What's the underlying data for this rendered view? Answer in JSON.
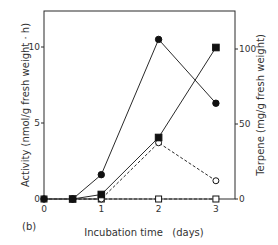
{
  "figure": {
    "panel_label": "(b)"
  },
  "chart_data": {
    "type": "line",
    "title": "",
    "panel_label": "(b)",
    "xlabel": "Incubation time   (days)",
    "ylabel_left": "Activity (nmol/g fresh weight · h)",
    "ylabel_right": "Terpene  (mg/g fresh weight)",
    "xlim": [
      0,
      3.35
    ],
    "ylim_left": [
      0,
      12.5
    ],
    "ylim_right": [
      0,
      125
    ],
    "x_ticks": [
      0,
      1,
      2,
      3
    ],
    "x_tick_labels": [
      "0",
      "1",
      "2",
      "3"
    ],
    "y_left_ticks": [
      0,
      5,
      10
    ],
    "y_left_tick_labels": [
      "0",
      "5",
      "10"
    ],
    "y_right_ticks": [
      0,
      50,
      100
    ],
    "y_right_tick_labels": [
      "0",
      "50",
      "100"
    ],
    "grid": false,
    "legend": null,
    "series": [
      {
        "name": "filled circles (solid line)",
        "marker": "filled-circle",
        "line": "solid",
        "axis": "left",
        "x": [
          0,
          0.5,
          1,
          2,
          3
        ],
        "y": [
          0,
          0,
          1.6,
          10.5,
          6.3
        ]
      },
      {
        "name": "filled squares (solid line)",
        "marker": "filled-square",
        "line": "solid",
        "axis": "right",
        "x": [
          0.5,
          1,
          2,
          3
        ],
        "y": [
          0,
          3,
          41,
          101
        ]
      },
      {
        "name": "open circles (dashed line)",
        "marker": "open-circle",
        "line": "dashed",
        "axis": "left",
        "x": [
          0.5,
          1,
          2,
          3
        ],
        "y": [
          0,
          0,
          3.7,
          1.2
        ]
      },
      {
        "name": "open squares (dashed line)",
        "marker": "open-square",
        "line": "dashed",
        "axis": "left",
        "x": [
          0,
          1,
          2,
          3
        ],
        "y": [
          0,
          0,
          0,
          0
        ]
      }
    ]
  }
}
